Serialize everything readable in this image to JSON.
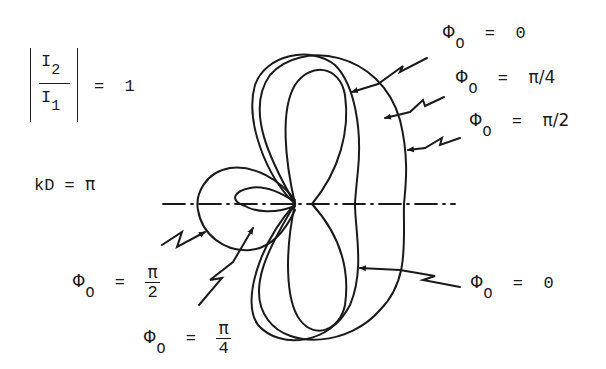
{
  "figure": {
    "ratio_expression": {
      "numerator": "I",
      "numerator_subscript": "2",
      "denominator": "I",
      "denominator_subscript": "1",
      "equals": "=",
      "value": "1"
    },
    "kd_expression": {
      "lhs": "kD",
      "equals": "=",
      "value": "π"
    },
    "labels": {
      "upper_zero": {
        "symbol": "Φ",
        "subscript": "O",
        "equals": "=",
        "value": "0"
      },
      "upper_pi4": {
        "symbol": "Φ",
        "subscript": "O",
        "equals": "=",
        "value": "π/4"
      },
      "upper_pi2": {
        "symbol": "Φ",
        "subscript": "O",
        "equals": "=",
        "value": "π/2"
      },
      "lower_zero": {
        "symbol": "Φ",
        "subscript": "O",
        "equals": "=",
        "value": "0"
      },
      "lower_pi2": {
        "symbol": "Φ",
        "subscript": "O",
        "equals": "=",
        "numerator": "π",
        "denominator": "2"
      },
      "lower_pi4": {
        "symbol": "Φ",
        "subscript": "O",
        "equals": "=",
        "numerator": "π",
        "denominator": "4"
      }
    },
    "pattern_curves": [
      {
        "name": "phi0-zero",
        "phase": "0"
      },
      {
        "name": "phi0-pi-over-4",
        "phase": "π/4"
      },
      {
        "name": "phi0-pi-over-2",
        "phase": "π/2"
      }
    ],
    "axis": {
      "style": "dash-dot"
    },
    "line_color": "#1a1a1a"
  }
}
